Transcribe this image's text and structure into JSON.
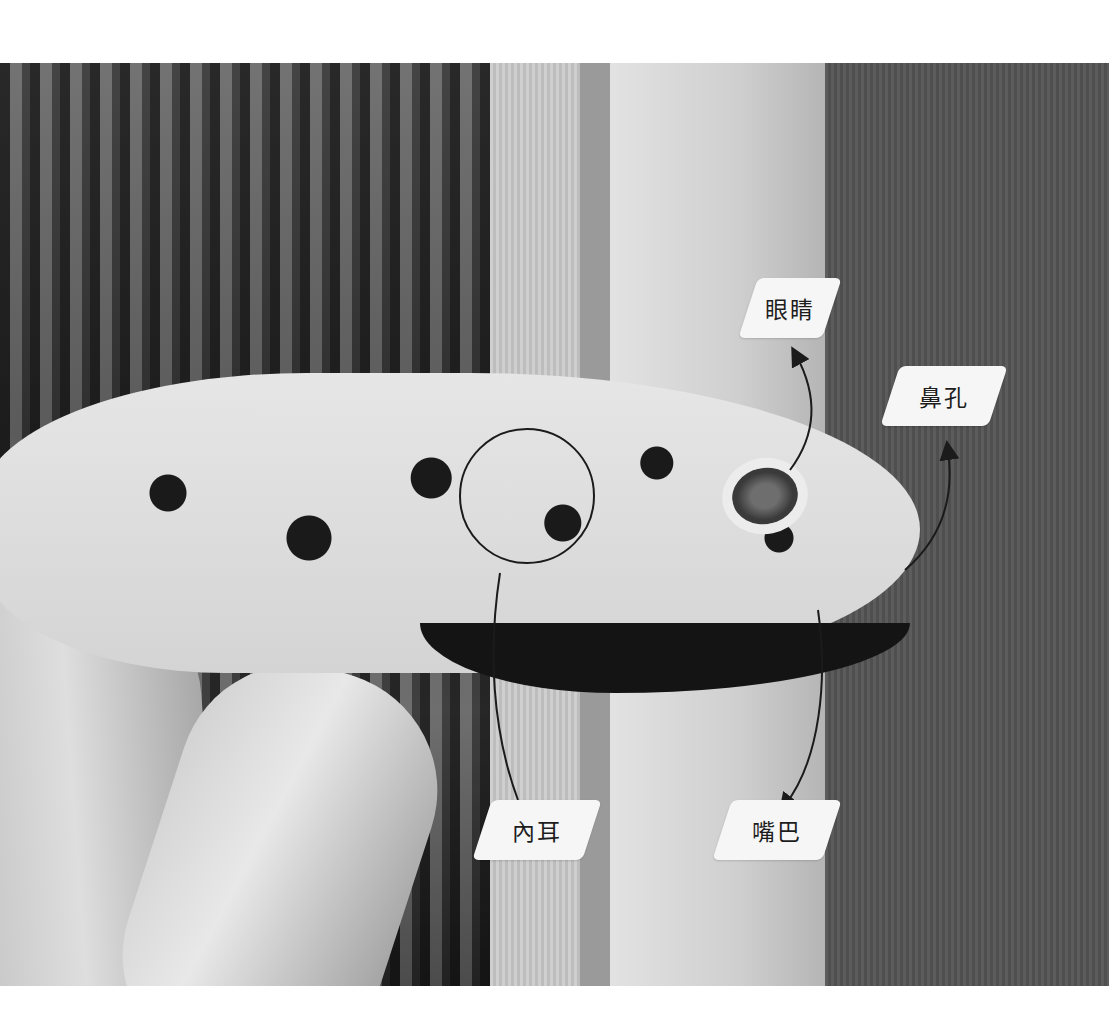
{
  "figure": {
    "labels": [
      {
        "id": "eye",
        "text": "眼睛"
      },
      {
        "id": "nostril",
        "text": "鼻孔"
      },
      {
        "id": "inner-ear",
        "text": "內耳"
      },
      {
        "id": "mouth",
        "text": "嘴巴"
      }
    ]
  },
  "colors": {
    "label_bg": "#f6f6f6",
    "label_text": "#1d1d1d",
    "arrow": "#1b1b1b"
  }
}
